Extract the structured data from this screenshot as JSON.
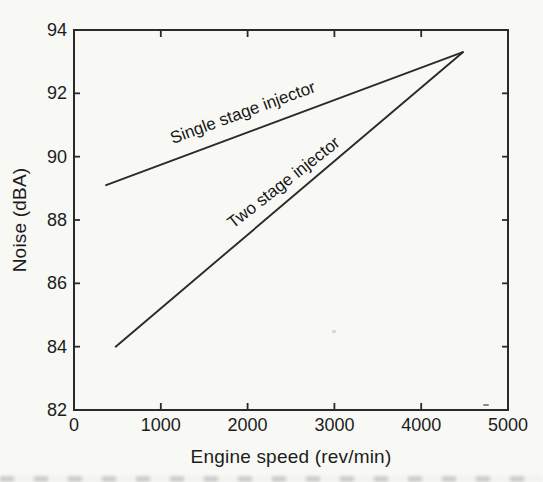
{
  "figure": {
    "paper_color": "#f8f8f5",
    "ink_color": "#2a2a2a",
    "text_color": "#1c1c1c"
  },
  "chart_data": {
    "type": "line",
    "title": "",
    "xlabel": "Engine speed (rev/min)",
    "ylabel": "Noise (dBA)",
    "xlim": [
      0,
      5000
    ],
    "ylim": [
      82,
      94
    ],
    "x_ticks": [
      0,
      1000,
      2000,
      3000,
      4000,
      5000
    ],
    "y_ticks": [
      82,
      84,
      86,
      88,
      90,
      92,
      94
    ],
    "grid": false,
    "legend": "inline rotated labels along lines",
    "series": [
      {
        "name": "Single stage injector",
        "x": [
          370,
          4480
        ],
        "y": [
          89.1,
          93.3
        ]
      },
      {
        "name": "Two stage injector",
        "x": [
          480,
          4480
        ],
        "y": [
          84.0,
          93.3
        ]
      }
    ]
  }
}
